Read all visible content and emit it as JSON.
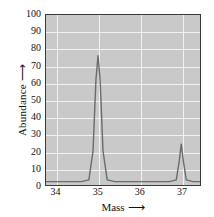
{
  "chart_data": {
    "type": "line",
    "title": "",
    "subtitle": "",
    "xlabel": "Mass",
    "xlabel_arrow": "⟶",
    "ylabel": "Abundance",
    "ylabel_arrow": "⟶",
    "xlim": [
      33.75,
      37.45
    ],
    "ylim": [
      0,
      100
    ],
    "xticks": [
      34,
      35,
      36,
      37
    ],
    "xtick_labels": [
      "34",
      "35",
      "36",
      "37"
    ],
    "yticks": [
      0,
      10,
      20,
      30,
      40,
      50,
      60,
      70,
      80,
      90,
      100
    ],
    "ytick_labels": [
      "0",
      "10",
      "20",
      "30",
      "40",
      "50",
      "60",
      "70",
      "80",
      "90",
      "100"
    ],
    "grid": true,
    "grid_color": "#f2f2f2",
    "plot_background": "#c9c9c9",
    "trace_color": "#6b6b6b",
    "frame_color": "#3a3a3a",
    "legend": null,
    "baseline": 2,
    "peaks": [
      {
        "mass": 35,
        "abundance": 76,
        "label": "35"
      },
      {
        "mass": 37,
        "abundance": 24,
        "label": "37"
      }
    ],
    "x": [
      33.75,
      34.6,
      34.78,
      34.88,
      34.95,
      35.0,
      35.05,
      35.12,
      35.22,
      35.4,
      36.72,
      36.88,
      36.95,
      37.0,
      37.05,
      37.12,
      37.28,
      37.45
    ],
    "y": [
      2,
      2,
      3,
      20,
      62,
      76,
      62,
      20,
      3,
      2,
      2,
      3,
      14,
      24,
      14,
      3,
      2,
      2
    ],
    "annotations": []
  }
}
